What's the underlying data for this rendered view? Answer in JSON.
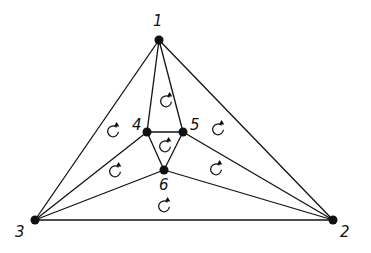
{
  "diagram": {
    "type": "planar-graph-triangulation",
    "colors": {
      "stroke": "#111111",
      "background": "#ffffff"
    },
    "nodes": [
      {
        "id": "1",
        "label": "1",
        "x": 159,
        "y": 40,
        "lx": 153,
        "ly": 26
      },
      {
        "id": "2",
        "label": "2",
        "x": 333,
        "y": 220,
        "lx": 340,
        "ly": 237
      },
      {
        "id": "3",
        "label": "3",
        "x": 35,
        "y": 220,
        "lx": 15,
        "ly": 237
      },
      {
        "id": "4",
        "label": "4",
        "x": 147,
        "y": 132,
        "lx": 132,
        "ly": 130
      },
      {
        "id": "5",
        "label": "5",
        "x": 183,
        "y": 132,
        "lx": 190,
        "ly": 130
      },
      {
        "id": "6",
        "label": "6",
        "x": 164,
        "y": 170,
        "lx": 159,
        "ly": 190
      }
    ],
    "edges": [
      [
        "1",
        "2"
      ],
      [
        "2",
        "3"
      ],
      [
        "3",
        "1"
      ],
      [
        "1",
        "4"
      ],
      [
        "1",
        "5"
      ],
      [
        "4",
        "5"
      ],
      [
        "4",
        "6"
      ],
      [
        "5",
        "6"
      ],
      [
        "3",
        "4"
      ],
      [
        "3",
        "6"
      ],
      [
        "2",
        "5"
      ],
      [
        "2",
        "6"
      ]
    ],
    "orientation_marks": [
      {
        "face": "1-3-4",
        "x": 113,
        "y": 130
      },
      {
        "face": "1-4-5",
        "x": 166,
        "y": 100
      },
      {
        "face": "1-5-2",
        "x": 218,
        "y": 128
      },
      {
        "face": "4-5-6",
        "x": 165,
        "y": 145
      },
      {
        "face": "3-4-6",
        "x": 115,
        "y": 170
      },
      {
        "face": "5-2-6",
        "x": 216,
        "y": 168
      },
      {
        "face": "3-6-2",
        "x": 164,
        "y": 205
      }
    ]
  }
}
